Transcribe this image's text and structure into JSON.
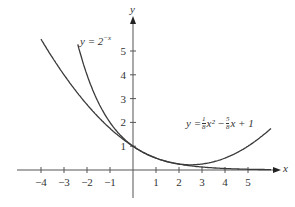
{
  "chart_data": {
    "type": "line",
    "title": "",
    "xlabel": "x",
    "ylabel": "y",
    "xlim": [
      -4.6,
      6.2
    ],
    "ylim": [
      -1.0,
      6.0
    ],
    "x_ticks": [
      -4,
      -3,
      -2,
      -1,
      1,
      2,
      3,
      4,
      5
    ],
    "y_ticks": [
      1,
      2,
      3,
      4,
      5
    ],
    "grid": false,
    "series": [
      {
        "name": "y = 2^(-x)",
        "label": "y = 2⁻ˣ",
        "expr": "2^(-x)",
        "x_range": [
          -2.4,
          6.0
        ]
      },
      {
        "name": "y = (1/8)x^2 - (5/8)x + 1",
        "label": "y = ⅛x² − ⁵⁄₈x + 1",
        "expr": "x^2/8 - 5x/8 + 1",
        "x_range": [
          -4.0,
          6.0
        ]
      }
    ],
    "annotations": [
      {
        "text": "y = 2^(-x)",
        "near": [
          -1.7,
          5.4
        ]
      },
      {
        "text": "y = 1/8 x^2 - 5/8 x + 1",
        "near": [
          3.5,
          1.6
        ]
      }
    ]
  },
  "labels": {
    "x_axis": "x",
    "y_axis": "y",
    "curve1": "y = 2",
    "curve1_exp": "−x",
    "curve2_prefix": "y = ",
    "curve2_mid": " x² − ",
    "curve2_suffix": " x + 1",
    "frac1_num": "1",
    "frac1_den": "8",
    "frac2_num": "5",
    "frac2_den": "8"
  },
  "colors": {
    "curve": "#3a3a3a",
    "axis": "#555555"
  }
}
